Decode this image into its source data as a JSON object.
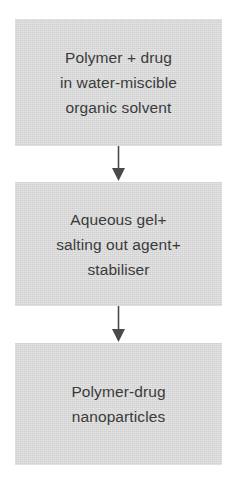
{
  "diagram": {
    "orientation": "vertical-top-down",
    "colors": {
      "box_fill": "#d6d6d6",
      "text": "#3b3b3b",
      "arrow": "#4a4a4a",
      "background": "#ffffff"
    },
    "nodes": [
      {
        "id": "precursor",
        "lines": [
          "Polymer + drug",
          "in water-miscible",
          "organic solvent"
        ]
      },
      {
        "id": "gel",
        "lines": [
          "Aqueous gel+",
          "salting out agent+",
          "stabiliser"
        ]
      },
      {
        "id": "product",
        "lines": [
          "Polymer-drug",
          "nanoparticles"
        ]
      }
    ],
    "connectors": [
      {
        "id": "arrow-1",
        "from": "precursor",
        "to": "gel",
        "glyph": "down-arrow-icon"
      },
      {
        "id": "arrow-2",
        "from": "gel",
        "to": "product",
        "glyph": "down-arrow-icon"
      }
    ]
  }
}
